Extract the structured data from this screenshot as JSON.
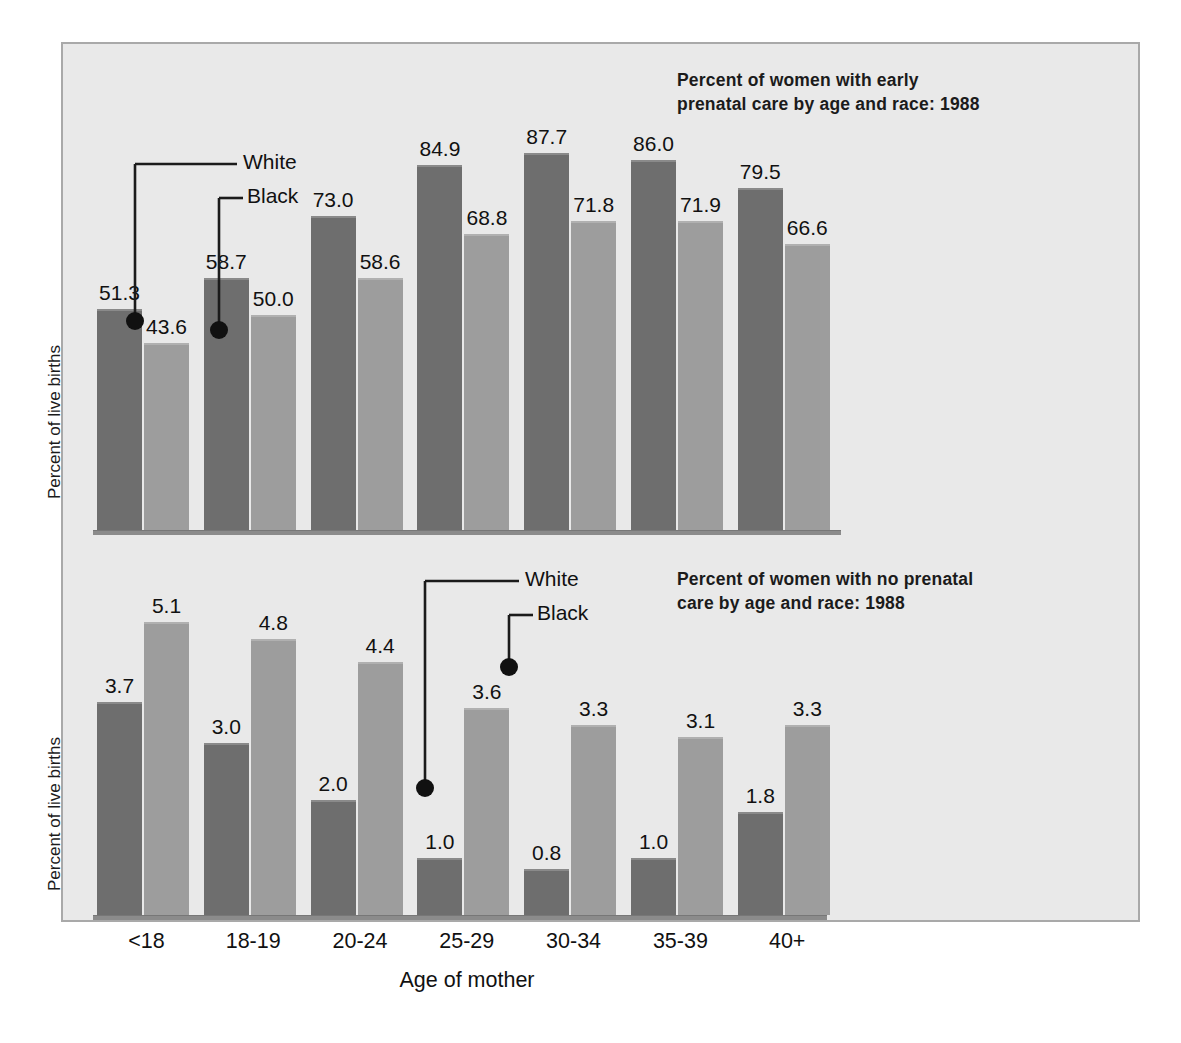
{
  "figure": {
    "xlabel": "Age of mother",
    "ylabel": "Percent of live births",
    "categories": [
      "<18",
      "18-19",
      "20-24",
      "25-29",
      "30-34",
      "35-39",
      "40+"
    ],
    "series_names": [
      "White",
      "Black"
    ],
    "colors": {
      "white_bar": "#6e6e6e",
      "black_bar": "#9d9d9d",
      "panel_background": "#e9e9e9",
      "panel_border": "#a9a9a9",
      "axis": "#8b8b8b",
      "text": "#111111"
    }
  },
  "chart_data": [
    {
      "type": "bar",
      "title": "Percent of women with early\nprenatal care by age and race: 1988",
      "xlabel": "Age of mother",
      "ylabel": "Percent of live births",
      "categories": [
        "<18",
        "18-19",
        "20-24",
        "25-29",
        "30-34",
        "35-39",
        "40+"
      ],
      "series": [
        {
          "name": "White",
          "values": [
            51.3,
            58.7,
            73.0,
            84.9,
            87.7,
            86.0,
            79.5
          ]
        },
        {
          "name": "Black",
          "values": [
            43.6,
            50.0,
            58.6,
            68.8,
            71.8,
            71.9,
            66.6
          ]
        }
      ],
      "labels": {
        "white": [
          "51.3",
          "58.7",
          "73.0",
          "84.9",
          "87.7",
          "86.0",
          "79.5"
        ],
        "black": [
          "43.6",
          "50.0",
          "58.6",
          "68.8",
          "71.8",
          "71.9",
          "66.6"
        ]
      },
      "ylim": [
        0,
        100
      ],
      "grid": false,
      "legend_position": "inside-upper-left-callouts",
      "annotations": [
        "White",
        "Black"
      ]
    },
    {
      "type": "bar",
      "title": "Percent of women with no prenatal\ncare by age and race: 1988",
      "xlabel": "Age of mother",
      "ylabel": "Percent of live births",
      "categories": [
        "<18",
        "18-19",
        "20-24",
        "25-29",
        "30-34",
        "35-39",
        "40+"
      ],
      "series": [
        {
          "name": "White",
          "values": [
            3.7,
            3.0,
            2.0,
            1.0,
            0.8,
            1.0,
            1.8
          ]
        },
        {
          "name": "Black",
          "values": [
            5.1,
            4.8,
            4.4,
            3.6,
            3.3,
            3.1,
            3.3
          ]
        }
      ],
      "labels": {
        "white": [
          "3.7",
          "3.0",
          "2.0",
          "1.0",
          "0.8",
          "1.0",
          "1.8"
        ],
        "black": [
          "5.1",
          "4.8",
          "4.4",
          "3.6",
          "3.3",
          "3.1",
          "3.3"
        ]
      },
      "ylim": [
        0,
        5.6
      ],
      "grid": false,
      "legend_position": "inside-upper-middle-callouts",
      "annotations": [
        "White",
        "Black"
      ]
    }
  ],
  "top": {
    "title": "Percent of women with early\nprenatal care by age and race: 1988",
    "callout_white": "White",
    "callout_black": "Black"
  },
  "bottom": {
    "title": "Percent of women with no prenatal\ncare by age and race: 1988",
    "callout_white": "White",
    "callout_black": "Black"
  }
}
